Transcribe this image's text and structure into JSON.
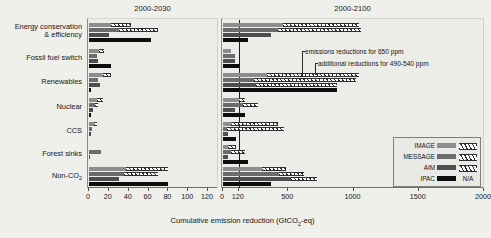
{
  "chart_data": {
    "type": "bar",
    "title": "",
    "xlabel": "Cumulative emission reduction (GtCO2-eq)",
    "ylabel": "",
    "grid": false,
    "orientation": "horizontal",
    "categories": [
      "Energy conservation & efficiency",
      "Fossil fuel switch",
      "Renewables",
      "Nuclear",
      "CCS",
      "Forest sinks",
      "Non-CO2"
    ],
    "legend": {
      "position": "inside-right-bottom",
      "entries": [
        {
          "name": "IMAGE",
          "solid_color": "#8d8d8d",
          "hatched": true,
          "hatch_note": ""
        },
        {
          "name": "MESSAGE",
          "solid_color": "#6b6b6b",
          "hatched": true,
          "hatch_note": ""
        },
        {
          "name": "AIM",
          "solid_color": "#4e4e4e",
          "hatched": true,
          "hatch_note": ""
        },
        {
          "name": "IPAC",
          "solid_color": "#0d0d0d",
          "hatched": false,
          "hatch_note": "N/A"
        }
      ]
    },
    "segment_meaning": {
      "solid": "emissions reductions for 650 ppm",
      "hatched": "additional reductions for 490-540 ppm"
    },
    "annotations": [
      "emissions reductions for 650 ppm",
      "additional reductions for 490-540 ppm"
    ],
    "panels": [
      {
        "id": "left",
        "title": "2000-2030",
        "xlim": [
          0,
          130
        ],
        "xticks": [
          0,
          20,
          40,
          60,
          80,
          100,
          120
        ],
        "xticklabels": [
          "0",
          "20",
          "40",
          "60",
          "80",
          "100",
          "120"
        ],
        "vline": null,
        "series": [
          {
            "name": "IMAGE",
            "solid": [
              22,
              10,
              14,
              8,
              5,
              0,
              37
            ],
            "hatched": [
              20,
              5,
              8,
              6,
              3,
              0,
              43
            ]
          },
          {
            "name": "MESSAGE",
            "solid": [
              30,
              8,
              9,
              6,
              3,
              12,
              35
            ],
            "hatched": [
              40,
              0,
              0,
              3,
              0,
              0,
              35
            ]
          },
          {
            "name": "AIM",
            "solid": [
              20,
              9,
              11,
              4,
              2,
              1,
              30
            ],
            "hatched": [
              0,
              0,
              0,
              0,
              0,
              0,
              0
            ]
          },
          {
            "name": "IPAC",
            "solid": [
              62,
              22,
              2,
              2,
              0,
              0,
              80
            ],
            "hatched": [
              0,
              0,
              0,
              0,
              0,
              0,
              0
            ]
          }
        ]
      },
      {
        "id": "right",
        "title": "2000-2100",
        "xlim": [
          0,
          2000
        ],
        "xticks": [
          0,
          120,
          500,
          1000,
          1500,
          2000
        ],
        "xticklabels": [
          "0",
          "120",
          "500",
          "1000",
          "1500",
          "2000"
        ],
        "vline": 120,
        "series": [
          {
            "name": "IMAGE",
            "solid": [
              460,
              60,
              340,
              120,
              60,
              40,
              300
            ],
            "hatched": [
              580,
              0,
              700,
              50,
              360,
              60,
              180
            ]
          },
          {
            "name": "MESSAGE",
            "solid": [
              420,
              90,
              240,
              150,
              30,
              60,
              430
            ],
            "hatched": [
              640,
              0,
              780,
              120,
              440,
              110,
              190
            ]
          },
          {
            "name": "AIM",
            "solid": [
              370,
              95,
              250,
              90,
              40,
              35,
              520
            ],
            "hatched": [
              0,
              0,
              620,
              0,
              0,
              0,
              200
            ]
          },
          {
            "name": "IPAC",
            "solid": [
              190,
              130,
              870,
              170,
              100,
              190,
              370
            ],
            "hatched": [
              0,
              0,
              0,
              0,
              0,
              0,
              0
            ]
          }
        ]
      }
    ]
  }
}
